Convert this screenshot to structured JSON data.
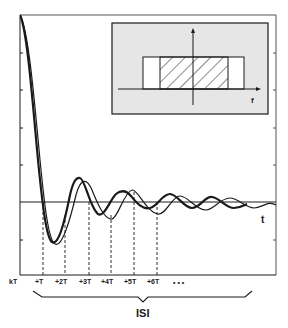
{
  "figure": {
    "type": "diagram",
    "time_axis_label": "t",
    "sample_labels": [
      "kT",
      "+T",
      "+2T",
      "+3T",
      "+4T",
      "+5T",
      "+6T"
    ],
    "ellipsis": "• • •",
    "brace_label": "ISI",
    "inset": {
      "axis_label": "f",
      "background": "#e6e6e6",
      "description": "Rectangular spectrum with hatched inner band centered at origin"
    },
    "colors": {
      "ink": "#1a1a1a",
      "background": "#ffffff",
      "inset_fill": "#e6e6e6"
    }
  }
}
